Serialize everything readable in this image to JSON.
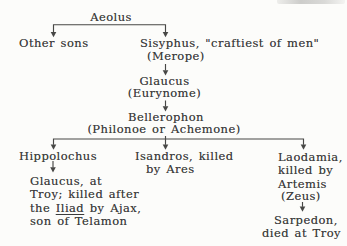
{
  "colors": {
    "paper": "#fcfcfa",
    "ink": "#3b3b3b",
    "line": "#474745"
  },
  "tree": {
    "aeolus": "Aeolus",
    "other_sons": "Other sons",
    "sisyphus": {
      "name": "Sisyphus, \"craftiest of men\"",
      "consort": "(Merope)"
    },
    "glaucus_elder": {
      "name": "Glaucus",
      "consort": "(Eurynome)"
    },
    "bellerophon": {
      "name": "Bellerophon",
      "consort": "(Philonoe or Achemone)"
    },
    "hippolochus": "Hippolochus",
    "isandros": {
      "line1": "Isandros, killed",
      "line2": "by Ares"
    },
    "laodamia": {
      "line1": "Laodamia,",
      "line2": "killed by",
      "line3": "Artemis",
      "line4": "(Zeus)"
    },
    "glaucus_younger": {
      "line1": "Glaucus, at",
      "line2": "Troy; killed after",
      "line3_pre": "the ",
      "line3_underlined": "Iliad",
      "line3_post": " by Ajax,",
      "line4": "son of Telamon"
    },
    "sarpedon": {
      "line1": "Sarpedon,",
      "line2": "died at Troy"
    }
  }
}
